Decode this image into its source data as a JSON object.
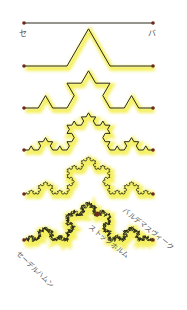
{
  "diagram": {
    "type": "koch-curve-iterations",
    "iterations": 5,
    "colors": {
      "line": "#2a2a1a",
      "glow": "#f4f060",
      "endpoint": "#6b2a1a",
      "label": "#555555"
    },
    "start_label": "セ",
    "end_label": "バ",
    "coast_labels": {
      "valdemarsvik": "バルデマスヴィーク",
      "stockholm": "ストックホルム",
      "soderhamn": "セーデルハムン"
    }
  }
}
